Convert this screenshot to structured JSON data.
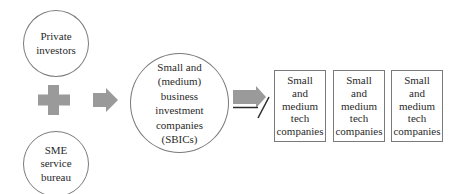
{
  "diagram": {
    "sources": [
      {
        "id": "private-investors",
        "label": "Private\ninvestors"
      },
      {
        "id": "sme-service-bureau",
        "label": "SME\nservice\nbureau"
      }
    ],
    "combine_symbol": "plus-icon",
    "intermediary": {
      "id": "sbics",
      "label": "Small and\n(medium)\nbusiness\ninvestment\ncompanies\n(SBICs)"
    },
    "targets": [
      {
        "id": "tech-company-1",
        "label": "Small\nand\nmedium\ntech\ncompanies"
      },
      {
        "id": "tech-company-2",
        "label": "Small\nand\nmedium\ntech\ncompanies"
      },
      {
        "id": "tech-company-3",
        "label": "Small\nand\nmedium\ntech\ncompanies"
      }
    ],
    "arrows": [
      {
        "from": "sources",
        "to": "sbics",
        "style": "block-arrow"
      },
      {
        "from": "sbics",
        "to": "targets",
        "style": "block-arrow-with-slash"
      }
    ],
    "colors": {
      "shape_fill": "#9a9a9a",
      "outline": "#7a7a7a",
      "text": "#2a2a2a",
      "background": "#ffffff"
    }
  }
}
